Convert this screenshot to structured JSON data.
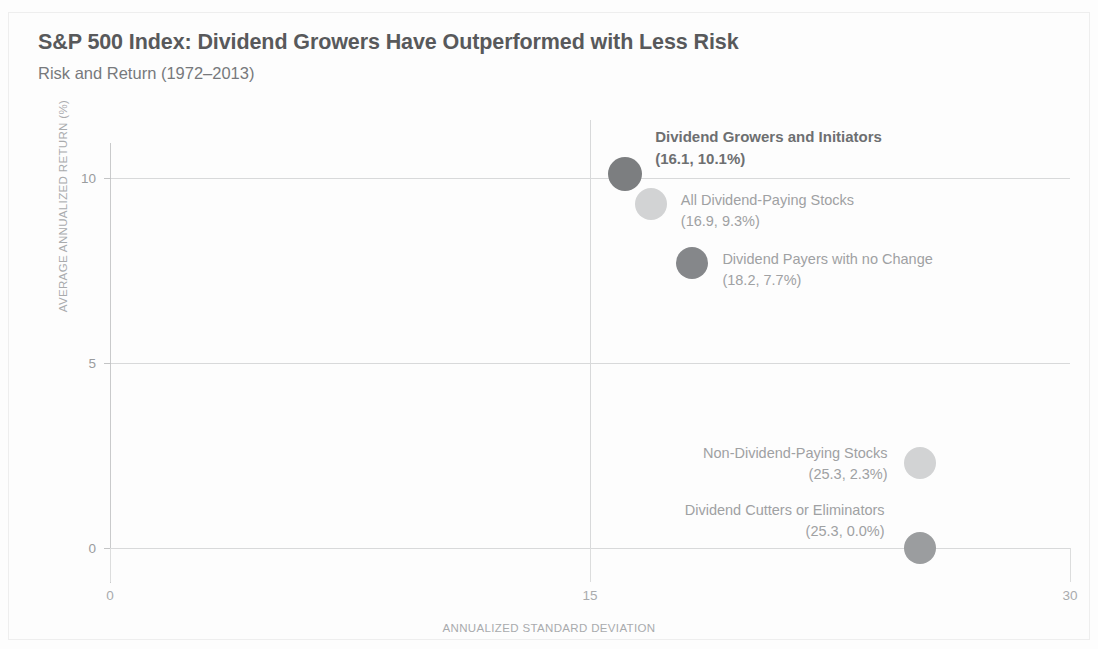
{
  "header": {
    "title": "S&P 500 Index: Dividend Growers Have Outperformed with Less Risk",
    "subtitle": "Risk and Return (1972–2013)"
  },
  "colors": {
    "marker_dark": "#7c7e80",
    "marker_mid": "#8e9092",
    "marker_light": "#d2d3d4",
    "grid": "#d8d9da",
    "title_text": "#58595b",
    "label_text": "#9a9c9e"
  },
  "chart_data": {
    "type": "scatter",
    "title": "S&P 500 Index: Dividend Growers Have Outperformed with Less Risk",
    "subtitle": "Risk and Return (1972–2013)",
    "xlabel": "ANNUALIZED STANDARD DEVIATION",
    "ylabel": "AVERAGE ANNUALIZED RETURN (%)",
    "xlim": [
      0,
      30
    ],
    "ylim": [
      0,
      11.4
    ],
    "xticks": [
      "0",
      "15",
      "30"
    ],
    "xtick_values": [
      0,
      15,
      30
    ],
    "yticks": [
      "0",
      "5",
      "10"
    ],
    "ytick_values": [
      0,
      5,
      10
    ],
    "grid": true,
    "legend": "none",
    "points": [
      {
        "name": "Dividend Growers and Initiators",
        "label": "Dividend Growers and Initiators",
        "value_label": "(16.1, 10.1%)",
        "x": 16.1,
        "y": 10.1,
        "color": "#7c7e80",
        "size": 34,
        "emphasis": true,
        "align": "left"
      },
      {
        "name": "All Dividend-Paying Stocks",
        "label": "All Dividend-Paying Stocks",
        "value_label": "(16.9, 9.3%)",
        "x": 16.9,
        "y": 9.3,
        "color": "#d2d3d4",
        "size": 32,
        "emphasis": false,
        "align": "left"
      },
      {
        "name": "Dividend Payers with no Change",
        "label": "Dividend Payers with no Change",
        "value_label": "(18.2, 7.7%)",
        "x": 18.2,
        "y": 7.7,
        "color": "#85878a",
        "size": 32,
        "emphasis": false,
        "align": "left"
      },
      {
        "name": "Non-Dividend-Paying Stocks",
        "label": "Non-Dividend-Paying Stocks",
        "value_label": "(25.3, 2.3%)",
        "x": 25.3,
        "y": 2.3,
        "color": "#d2d3d4",
        "size": 32,
        "emphasis": false,
        "align": "right"
      },
      {
        "name": "Dividend Cutters or Eliminators",
        "label": "Dividend Cutters or Eliminators",
        "value_label": "(25.3, 0.0%)",
        "x": 25.3,
        "y": 0.0,
        "color": "#9b9d9f",
        "size": 32,
        "emphasis": false,
        "align": "right"
      }
    ]
  }
}
